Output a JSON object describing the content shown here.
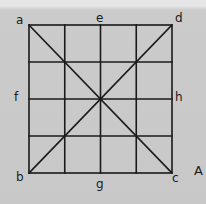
{
  "figure": {
    "labels": {
      "a": "a",
      "b": "b",
      "c": "c",
      "d": "d",
      "e": "e",
      "f": "f",
      "g": "g",
      "h": "h",
      "figure_id": "A"
    },
    "grid": {
      "rows": 4,
      "cols": 4
    },
    "diagonals": [
      "a-c",
      "d-b"
    ],
    "colors": {
      "line": "#1a1a1a",
      "background": "#c9c9c9"
    }
  }
}
